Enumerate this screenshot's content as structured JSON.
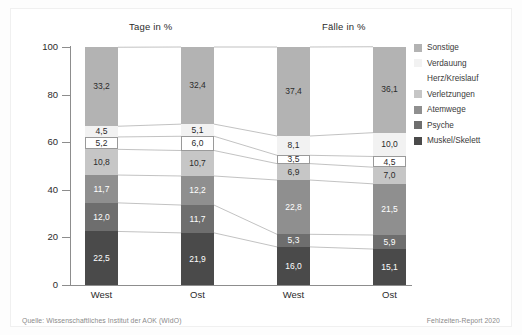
{
  "figure": {
    "source_note": "Quelle: Wissenschaftliches Institut der AOK (WIdO)",
    "report_note": "Fehlzeiten-Report 2020"
  },
  "panels": [
    {
      "id": "tage",
      "title": "Tage in %"
    },
    {
      "id": "faelle",
      "title": "Fälle in %"
    }
  ],
  "legend": {
    "items": [
      {
        "label": "Sonstige",
        "color": "#b3b3b3"
      },
      {
        "label": "Verdauung",
        "color": "#f2f2f2"
      },
      {
        "label": "Herz/Kreislauf",
        "color": "#ffffff"
      },
      {
        "label": "Verletzungen",
        "color": "#c6c6c6"
      },
      {
        "label": "Atemwege",
        "color": "#8f8f8f"
      },
      {
        "label": "Psyche",
        "color": "#6e6e6e"
      },
      {
        "label": "Muskel/Skelett",
        "color": "#4a4a4a"
      }
    ]
  },
  "axis": {
    "y_ticks": [
      "0",
      "20",
      "40",
      "60",
      "80",
      "100"
    ],
    "x_labels": [
      "West",
      "Ost",
      "West",
      "Ost"
    ]
  },
  "chart_data": {
    "type": "bar",
    "title": "",
    "subtitle": "",
    "stacked": true,
    "orientation": "vertical",
    "xlabel": "",
    "ylabel": "",
    "ylim": [
      0,
      100
    ],
    "yticks": [
      0,
      20,
      40,
      60,
      80,
      100
    ],
    "grid": false,
    "legend_position": "right",
    "panels": [
      "Tage in %",
      "Fälle in %"
    ],
    "categories": [
      "West",
      "Ost",
      "West",
      "Ost"
    ],
    "series": [
      {
        "name": "Muskel/Skelett",
        "color": "#4a4a4a",
        "text_color": "#ffffff",
        "values": [
          22.5,
          21.9,
          16.0,
          15.1
        ],
        "labels": [
          "22,5",
          "21,9",
          "16,0",
          "15,1"
        ]
      },
      {
        "name": "Psyche",
        "color": "#6e6e6e",
        "text_color": "#ffffff",
        "values": [
          12.0,
          11.7,
          5.3,
          5.9
        ],
        "labels": [
          "12,0",
          "11,7",
          "5,3",
          "5,9"
        ]
      },
      {
        "name": "Atemwege",
        "color": "#8f8f8f",
        "text_color": "#ffffff",
        "values": [
          11.7,
          12.2,
          22.8,
          21.5
        ],
        "labels": [
          "11,7",
          "12,2",
          "22,8",
          "21,5"
        ]
      },
      {
        "name": "Verletzungen",
        "color": "#c6c6c6",
        "text_color": "#2b2b2b",
        "values": [
          10.8,
          10.7,
          6.9,
          7.0
        ],
        "labels": [
          "10,8",
          "10,7",
          "6,9",
          "7,0"
        ]
      },
      {
        "name": "Herz/Kreislauf",
        "color": "#ffffff",
        "text_color": "#2b2b2b",
        "values": [
          5.2,
          6.0,
          3.5,
          4.5
        ],
        "labels": [
          "5,2",
          "6,0",
          "3,5",
          "4,5"
        ]
      },
      {
        "name": "Verdauung",
        "color": "#f2f2f2",
        "text_color": "#2b2b2b",
        "values": [
          4.5,
          5.1,
          8.1,
          10.0
        ],
        "labels": [
          "4,5",
          "5,1",
          "8,1",
          "10,0"
        ]
      },
      {
        "name": "Sonstige",
        "color": "#b3b3b3",
        "text_color": "#2b2b2b",
        "values": [
          33.2,
          32.4,
          37.4,
          36.1
        ],
        "labels": [
          "33,2",
          "32,4",
          "37,4",
          "36,1"
        ]
      }
    ]
  }
}
